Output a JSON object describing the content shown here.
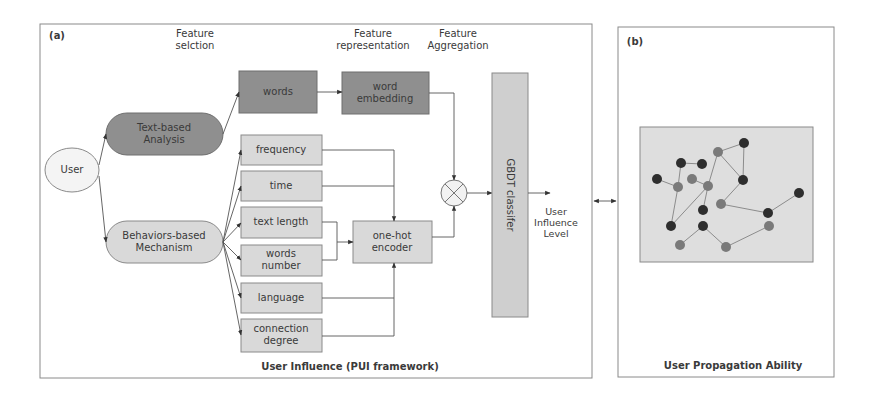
{
  "panel_a": {
    "tag": "(a)",
    "caption": "User Influence (PUI framework)",
    "headers": {
      "feature_selection": "Feature\nselction",
      "feature_representation": "Feature\nrepresentation",
      "feature_aggregation": "Feature\nAggregation"
    },
    "user": "User",
    "text_based": "Text-based\nAnalysis",
    "behaviors_based": "Behaviors-based\nMechanism",
    "words": "words",
    "word_embedding": "word\nembedding",
    "features": [
      "frequency",
      "time",
      "text length",
      "words\nnumber",
      "language",
      "connection\ndegree"
    ],
    "one_hot_encoder": "one-hot\nencoder",
    "aggregation_icon": "circled-times-icon",
    "classifier": "GBDT classifer",
    "output": "User\nInfluence\nLevel"
  },
  "panel_b": {
    "tag": "(b)",
    "caption": "User Propagation Ability",
    "network": {
      "nodes": [
        {
          "id": "A",
          "x": 718,
          "y": 152,
          "shade": "gray"
        },
        {
          "id": "B",
          "x": 744,
          "y": 143,
          "shade": "dark"
        },
        {
          "id": "C",
          "x": 743,
          "y": 180,
          "shade": "dark"
        },
        {
          "id": "D",
          "x": 681,
          "y": 163,
          "shade": "dark"
        },
        {
          "id": "E",
          "x": 702,
          "y": 164,
          "shade": "dark"
        },
        {
          "id": "F",
          "x": 657,
          "y": 179,
          "shade": "dark"
        },
        {
          "id": "G",
          "x": 692,
          "y": 179,
          "shade": "gray"
        },
        {
          "id": "H",
          "x": 678,
          "y": 187,
          "shade": "gray"
        },
        {
          "id": "I",
          "x": 708,
          "y": 186,
          "shade": "gray"
        },
        {
          "id": "J",
          "x": 721,
          "y": 204,
          "shade": "gray"
        },
        {
          "id": "K",
          "x": 703,
          "y": 210,
          "shade": "dark"
        },
        {
          "id": "L",
          "x": 671,
          "y": 226,
          "shade": "dark"
        },
        {
          "id": "M",
          "x": 703,
          "y": 226,
          "shade": "dark"
        },
        {
          "id": "N",
          "x": 680,
          "y": 245,
          "shade": "gray"
        },
        {
          "id": "O",
          "x": 726,
          "y": 247,
          "shade": "gray"
        },
        {
          "id": "P",
          "x": 768,
          "y": 213,
          "shade": "dark"
        },
        {
          "id": "Q",
          "x": 769,
          "y": 226,
          "shade": "gray"
        },
        {
          "id": "R",
          "x": 799,
          "y": 193,
          "shade": "dark"
        }
      ],
      "edges": [
        [
          "A",
          "B"
        ],
        [
          "B",
          "C"
        ],
        [
          "A",
          "C"
        ],
        [
          "A",
          "I"
        ],
        [
          "D",
          "E"
        ],
        [
          "D",
          "H"
        ],
        [
          "F",
          "H"
        ],
        [
          "H",
          "L"
        ],
        [
          "L",
          "I"
        ],
        [
          "G",
          "I"
        ],
        [
          "I",
          "K"
        ],
        [
          "C",
          "J"
        ],
        [
          "J",
          "P"
        ],
        [
          "M",
          "N"
        ],
        [
          "M",
          "O"
        ],
        [
          "O",
          "Q"
        ],
        [
          "P",
          "R"
        ]
      ],
      "colors": {
        "dark": "#2e2e2e",
        "gray": "#7a7a7a"
      }
    }
  },
  "connector": "bidirectional-arrow"
}
